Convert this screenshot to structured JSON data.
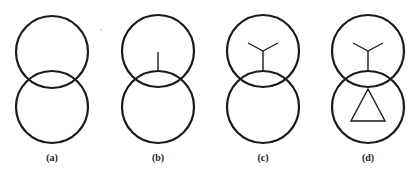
{
  "figure": {
    "panels": [
      {
        "label": "(a)",
        "cx": 52,
        "top_circle": {
          "cy": 52,
          "r": 36
        },
        "bottom_circle": {
          "cy": 107,
          "r": 36
        },
        "marks": []
      },
      {
        "label": "(b)",
        "cx": 158,
        "top_circle": {
          "cy": 51,
          "r": 36
        },
        "bottom_circle": {
          "cy": 107,
          "r": 36
        },
        "marks": [
          "vertical-line"
        ]
      },
      {
        "label": "(c)",
        "cx": 263,
        "top_circle": {
          "cy": 51,
          "r": 36
        },
        "bottom_circle": {
          "cy": 107,
          "r": 36
        },
        "marks": [
          "wye-symbol"
        ]
      },
      {
        "label": "(d)",
        "cx": 368,
        "top_circle": {
          "cy": 51,
          "r": 36
        },
        "bottom_circle": {
          "cy": 107,
          "r": 36
        },
        "marks": [
          "wye-symbol",
          "delta-triangle"
        ]
      }
    ],
    "colors": {
      "stroke": "#1a1a1a",
      "background": "#ffffff"
    }
  }
}
